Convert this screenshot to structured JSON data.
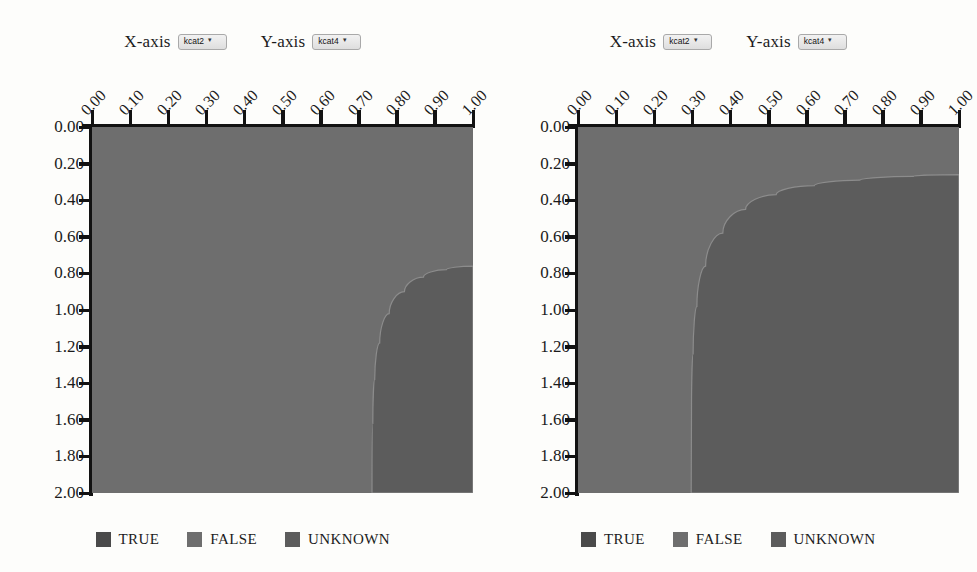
{
  "panels": [
    {
      "id": "left-panel",
      "controls": {
        "x": {
          "label": "X-axis",
          "value": "kcat2",
          "caret": "chevron-down-icon"
        },
        "y": {
          "label": "Y-axis",
          "value": "kcat4",
          "caret": "chevron-down-icon"
        }
      },
      "legend": [
        {
          "label": "TRUE",
          "color": "#4a4a4a"
        },
        {
          "label": "FALSE",
          "color": "#6e6e6e"
        },
        {
          "label": "UNKNOWN",
          "color": "#5c5c5c"
        }
      ]
    },
    {
      "id": "right-panel",
      "controls": {
        "x": {
          "label": "X-axis",
          "value": "kcat2",
          "caret": "chevron-down-icon"
        },
        "y": {
          "label": "Y-axis",
          "value": "kcat4",
          "caret": "chevron-down-icon"
        }
      },
      "legend": [
        {
          "label": "TRUE",
          "color": "#4a4a4a"
        },
        {
          "label": "FALSE",
          "color": "#6e6e6e"
        },
        {
          "label": "UNKNOWN",
          "color": "#5c5c5c"
        }
      ]
    }
  ],
  "chart_data": [
    {
      "type": "heatmap",
      "title": "",
      "xlabel": "kcat2",
      "ylabel": "kcat4",
      "xlim": [
        0.0,
        1.0
      ],
      "ylim": [
        0.0,
        2.0
      ],
      "x_ticks": [
        "0.00",
        "0.10",
        "0.20",
        "0.30",
        "0.40",
        "0.50",
        "0.60",
        "0.70",
        "0.80",
        "0.90",
        "1.00"
      ],
      "y_ticks": [
        "0.00",
        "0.20",
        "0.40",
        "0.60",
        "0.80",
        "1.00",
        "1.20",
        "1.40",
        "1.60",
        "1.80",
        "2.00"
      ],
      "x_tick_values": [
        0.0,
        0.1,
        0.2,
        0.3,
        0.4,
        0.5,
        0.6,
        0.7,
        0.8,
        0.9,
        1.0
      ],
      "y_tick_values": [
        0.0,
        0.2,
        0.4,
        0.6,
        0.8,
        1.0,
        1.2,
        1.4,
        1.6,
        1.8,
        2.0
      ],
      "x_axis_position": "top",
      "y_axis_direction": "down",
      "grid": false,
      "legend_position": "bottom",
      "categories": [
        "TRUE",
        "FALSE",
        "UNKNOWN"
      ],
      "region_colors": {
        "TRUE": "#4a4a4a",
        "FALSE": "#6e6e6e",
        "UNKNOWN": "#5c5c5c"
      },
      "background_region": "FALSE",
      "dark_region_label": "UNKNOWN",
      "dark_region_boundary_xy": [
        [
          1.0,
          0.76
        ],
        [
          0.93,
          0.78
        ],
        [
          0.87,
          0.82
        ],
        [
          0.82,
          0.9
        ],
        [
          0.78,
          1.02
        ],
        [
          0.755,
          1.18
        ],
        [
          0.742,
          1.38
        ],
        [
          0.737,
          1.62
        ],
        [
          0.735,
          2.0
        ]
      ],
      "dark_region_area_fraction": 0.17
    },
    {
      "type": "heatmap",
      "title": "",
      "xlabel": "kcat2",
      "ylabel": "kcat4",
      "xlim": [
        0.0,
        1.0
      ],
      "ylim": [
        0.0,
        2.0
      ],
      "x_ticks": [
        "0.00",
        "0.10",
        "0.20",
        "0.30",
        "0.40",
        "0.50",
        "0.60",
        "0.70",
        "0.80",
        "0.90",
        "1.00"
      ],
      "y_ticks": [
        "0.00",
        "0.20",
        "0.40",
        "0.60",
        "0.80",
        "1.00",
        "1.20",
        "1.40",
        "1.60",
        "1.80",
        "2.00"
      ],
      "x_tick_values": [
        0.0,
        0.1,
        0.2,
        0.3,
        0.4,
        0.5,
        0.6,
        0.7,
        0.8,
        0.9,
        1.0
      ],
      "y_tick_values": [
        0.0,
        0.2,
        0.4,
        0.6,
        0.8,
        1.0,
        1.2,
        1.4,
        1.6,
        1.8,
        2.0
      ],
      "x_axis_position": "top",
      "y_axis_direction": "down",
      "grid": false,
      "legend_position": "bottom",
      "categories": [
        "TRUE",
        "FALSE",
        "UNKNOWN"
      ],
      "region_colors": {
        "TRUE": "#4a4a4a",
        "FALSE": "#6e6e6e",
        "UNKNOWN": "#5c5c5c"
      },
      "background_region": "FALSE",
      "dark_region_label": "UNKNOWN",
      "dark_region_boundary_xy": [
        [
          1.0,
          0.26
        ],
        [
          0.88,
          0.27
        ],
        [
          0.74,
          0.29
        ],
        [
          0.62,
          0.32
        ],
        [
          0.52,
          0.37
        ],
        [
          0.44,
          0.45
        ],
        [
          0.38,
          0.58
        ],
        [
          0.335,
          0.76
        ],
        [
          0.312,
          0.98
        ],
        [
          0.302,
          1.24
        ],
        [
          0.298,
          1.55
        ],
        [
          0.297,
          2.0
        ]
      ],
      "dark_region_area_fraction": 0.58
    }
  ]
}
